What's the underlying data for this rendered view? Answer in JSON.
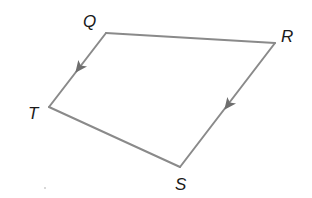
{
  "diagram": {
    "type": "quadrilateral",
    "shape_name": "trapezium QRST",
    "colors": {
      "edge": "#8a8a8a",
      "arrow": "#6e6e6e",
      "label": "#1a1a1a",
      "background": "#ffffff"
    },
    "vertices": [
      {
        "id": "Q",
        "label": "Q",
        "x": 106,
        "y": 33,
        "label_x": 83,
        "label_y": 27
      },
      {
        "id": "R",
        "label": "R",
        "x": 275,
        "y": 43,
        "label_x": 281,
        "label_y": 42
      },
      {
        "id": "S",
        "label": "S",
        "x": 180,
        "y": 167,
        "label_x": 175,
        "label_y": 190
      },
      {
        "id": "T",
        "label": "T",
        "x": 49,
        "y": 107,
        "label_x": 28,
        "label_y": 119
      }
    ],
    "edges": [
      {
        "from": "Q",
        "to": "R"
      },
      {
        "from": "R",
        "to": "S",
        "arrow": true,
        "arrow_direction": "towards S"
      },
      {
        "from": "S",
        "to": "T"
      },
      {
        "from": "T",
        "to": "Q",
        "arrow": true,
        "arrow_direction": "towards T"
      }
    ],
    "parallel_sides": [
      "QT",
      "RS"
    ],
    "annotation": "Arrow marks indicate QT is parallel to RS"
  }
}
